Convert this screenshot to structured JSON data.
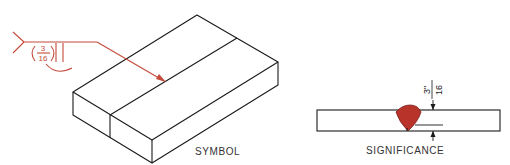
{
  "figure": {
    "symbol_label": "SYMBOL",
    "significance_label": "SIGNIFICANCE",
    "weld_symbol": {
      "size_numerator": "3",
      "size_denominator": "16",
      "size_display": "(3/16)",
      "type": "square-groove weld with convex contour (melt-thru)",
      "color": "#c0392b"
    },
    "dimension": {
      "value": "3\"/16",
      "numerator": "3\"",
      "denominator": "16"
    },
    "colors": {
      "line": "#1a1a1a",
      "symbol": "#c44a3a",
      "weld_fill": "#b8332a"
    }
  }
}
